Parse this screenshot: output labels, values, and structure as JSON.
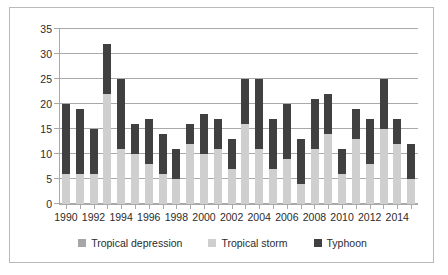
{
  "chart_data": {
    "type": "bar",
    "stacked": true,
    "title": "",
    "xlabel": "",
    "ylabel": "",
    "ylim": [
      0,
      35
    ],
    "yticks": [
      0,
      5,
      10,
      15,
      20,
      25,
      30,
      35
    ],
    "grid": true,
    "legend_position": "bottom",
    "categories": [
      "1990",
      "1991",
      "1992",
      "1993",
      "1994",
      "1995",
      "1996",
      "1997",
      "1998",
      "1999",
      "2000",
      "2001",
      "2002",
      "2003",
      "2004",
      "2005",
      "2006",
      "2007",
      "2008",
      "2009",
      "2010",
      "2011",
      "2012",
      "2013",
      "2014",
      "2015"
    ],
    "xtick_labels": [
      "1990",
      "1992",
      "1994",
      "1996",
      "1998",
      "2000",
      "2002",
      "2004",
      "2006",
      "2008",
      "2010",
      "2012",
      "2014"
    ],
    "series": [
      {
        "name": "Tropical depression",
        "color": "#a6a6a6",
        "values": [
          0,
          0,
          0,
          0,
          0,
          0,
          0,
          0,
          0,
          0,
          0,
          0,
          0,
          0,
          0,
          0,
          0,
          0,
          0,
          0,
          0,
          0,
          0,
          0,
          0,
          0
        ]
      },
      {
        "name": "Tropical storm",
        "color": "#cfcfcf",
        "values": [
          6,
          6,
          6,
          22,
          11,
          10,
          8,
          6,
          5,
          12,
          10,
          11,
          7,
          16,
          11,
          7,
          9,
          4,
          11,
          14,
          6,
          13,
          8,
          15,
          12,
          5
        ]
      },
      {
        "name": "Typhoon",
        "color": "#404040",
        "values": [
          14,
          13,
          9,
          10,
          14,
          6,
          9,
          8,
          6,
          4,
          8,
          6,
          6,
          9,
          14,
          10,
          11,
          9,
          10,
          8,
          5,
          6,
          9,
          10,
          5,
          7
        ]
      }
    ],
    "totals": [
      20,
      19,
      15,
      32,
      25,
      16,
      17,
      14,
      11,
      16,
      18,
      17,
      13,
      25,
      25,
      17,
      20,
      13,
      21,
      22,
      11,
      19,
      17,
      25,
      17,
      12
    ]
  },
  "legend": {
    "items": [
      {
        "label": "Tropical depression",
        "swatch": "#a6a6a6"
      },
      {
        "label": "Tropical storm",
        "swatch": "#cfcfcf"
      },
      {
        "label": "Typhoon",
        "swatch": "#404040"
      }
    ]
  }
}
